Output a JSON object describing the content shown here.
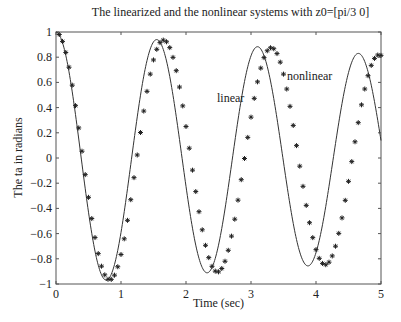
{
  "chart_data": {
    "type": "line",
    "title": "The linearized and the nonlinear systems with z0=[pi/3 0]",
    "xlabel": "Time (sec)",
    "ylabel": "The ta in radians",
    "xlim": [
      0,
      5
    ],
    "ylim": [
      -1,
      1
    ],
    "xticks": [
      "0",
      "1",
      "2",
      "3",
      "4",
      "5"
    ],
    "yticks": [
      "1",
      "0.8",
      "0.6",
      "0.4",
      "0.2",
      "0",
      "-0.2",
      "-0.4",
      "-0.6",
      "-0.8",
      "-1"
    ],
    "grid": false,
    "legend": "none (inline annotations)",
    "annotations": [
      {
        "text": "linear",
        "x": 2.5,
        "y": 0.5
      },
      {
        "text": "nonlinear",
        "x": 3.55,
        "y": 0.7
      }
    ],
    "series": [
      {
        "name": "linear",
        "style": "solid line",
        "model": "theta(t) = 1.0 * exp(-0.04 t) * cos(4.05 t)",
        "extrema": [
          [
            0,
            1.0
          ],
          [
            0.78,
            -1.0
          ],
          [
            1.57,
            0.95
          ],
          [
            2.35,
            -0.92
          ],
          [
            3.12,
            0.88
          ],
          [
            3.9,
            -0.85
          ],
          [
            4.66,
            0.82
          ],
          [
            5.0,
            0.22
          ]
        ]
      },
      {
        "name": "nonlinear",
        "style": "star markers",
        "model": "theta(t) = 1.0 * exp(-0.04 t) * cos(3.79 t)",
        "extrema": [
          [
            0,
            1.0
          ],
          [
            0.83,
            -1.0
          ],
          [
            1.68,
            0.95
          ],
          [
            2.5,
            -0.92
          ],
          [
            3.3,
            0.87
          ],
          [
            4.12,
            -0.85
          ],
          [
            4.95,
            0.8
          ]
        ]
      }
    ]
  },
  "labels": {
    "title": "The linearized and the nonlinear systems with z0=[pi/3 0]",
    "xlabel": "Time (sec)",
    "ylabel": "The ta in radians",
    "linear": "linear",
    "nonlinear": "nonlinear"
  }
}
